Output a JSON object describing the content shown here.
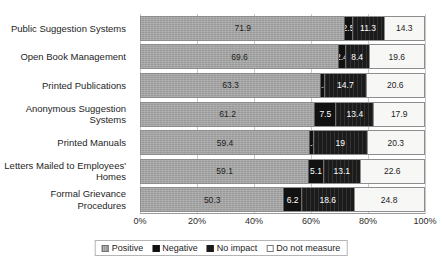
{
  "chart_data": {
    "type": "bar",
    "orientation": "horizontal",
    "stacked": true,
    "normalized_percent": true,
    "title": "",
    "xlabel": "",
    "ylabel": "",
    "xlim": [
      0,
      100
    ],
    "grid": true,
    "legend_position": "bottom",
    "categories": [
      "Public Suggestion Systems",
      "Open Book Management",
      "Printed Publications",
      "Anonymous Suggestion Systems",
      "Printed Manuals",
      "Letters Mailed to Employees' Homes",
      "Formal Grievance Procedures"
    ],
    "xticks": [
      "0%",
      "20%",
      "40%",
      "60%",
      "80%",
      "100%"
    ],
    "xtick_values": [
      0,
      20,
      40,
      60,
      80,
      100
    ],
    "series": [
      {
        "name": "Positive",
        "color": "#9a9a9a",
        "values": [
          71.9,
          69.6,
          63.3,
          61.2,
          59.4,
          59.1,
          50.3
        ],
        "labels": [
          "71.9",
          "69.6",
          "63.3",
          "61.2",
          "59.4",
          "59.1",
          "50.3"
        ]
      },
      {
        "name": "Negative",
        "color": "#111111",
        "values": [
          2.5,
          2.4,
          1.4,
          7.5,
          1.3,
          5.1,
          6.2
        ],
        "labels": [
          "2.5",
          "2.4",
          "1.4",
          "7.5",
          "1.3",
          "5.1",
          "6.2"
        ]
      },
      {
        "name": "No impact",
        "color": "#1b1b1b",
        "values": [
          11.3,
          8.4,
          14.7,
          13.4,
          19.0,
          13.1,
          18.6
        ],
        "labels": [
          "11.3",
          "8.4",
          "14.7",
          "13.4",
          "19",
          "13.1",
          "18.6"
        ]
      },
      {
        "name": "Do not measure",
        "color": "#f7f7f5",
        "values": [
          14.3,
          19.6,
          20.6,
          17.9,
          20.3,
          22.6,
          24.8
        ],
        "labels": [
          "14.3",
          "19.6",
          "20.6",
          "17.9",
          "20.3",
          "22.6",
          "24.8"
        ]
      }
    ],
    "legend": [
      "Positive",
      "Negative",
      "No impact",
      "Do not measure"
    ]
  }
}
